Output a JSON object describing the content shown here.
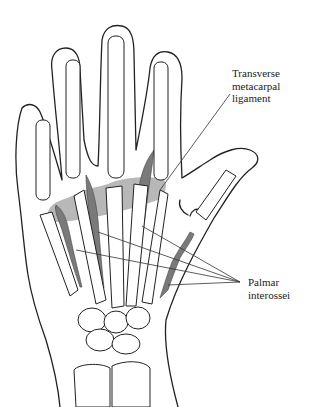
{
  "diagram": {
    "labels": {
      "ligament": [
        "Transverse",
        "metacarpal",
        "ligament"
      ],
      "interossei": [
        "Palmar",
        "interossei"
      ]
    },
    "colors": {
      "outline": "#222222",
      "ligament_fill": "#b8b8b8",
      "muscle_fill": "#7a7a7a",
      "background": "#ffffff"
    }
  }
}
